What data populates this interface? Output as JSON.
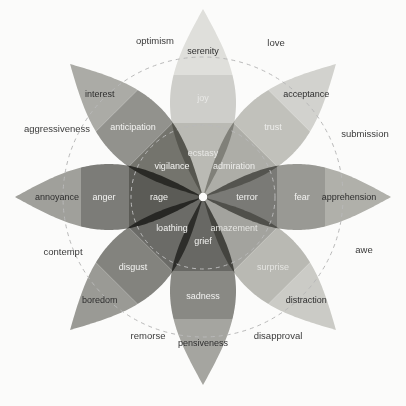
{
  "figure": {
    "name": "plutchik-wheel-of-emotions",
    "background": "#fbfbfa",
    "center": {
      "x": 203,
      "y": 197
    },
    "guide_circles": [
      {
        "name": "inner-dashed-circle",
        "r": 72
      },
      {
        "name": "outer-dashed-circle",
        "r": 140
      }
    ],
    "dash_color": "#b9b9b9"
  },
  "chart_data": {
    "type": "pie",
    "xlabel": "",
    "ylabel": "",
    "legend_position": "none",
    "grid": true,
    "petal_count": 8,
    "intensity_levels": [
      "mild",
      "basic",
      "intense"
    ],
    "categories": [
      "joy",
      "trust",
      "fear",
      "surprise",
      "sadness",
      "disgust",
      "anger",
      "anticipation"
    ],
    "values": [
      1,
      1,
      1,
      1,
      1,
      1,
      1,
      1
    ]
  },
  "petals": [
    {
      "name": "petal-joy",
      "angle": 0,
      "outer": {
        "label": "serenity",
        "fill": "#e3e3e0",
        "text": "#2e2e2e"
      },
      "mid": {
        "label": "joy",
        "fill": "#d2d2ce",
        "text": "#e8e8e6"
      },
      "inner": {
        "label": "ecstasy",
        "fill": "#bdbdb8",
        "text": "#e8e8e6"
      }
    },
    {
      "name": "petal-trust",
      "angle": 45,
      "outer": {
        "label": "acceptance",
        "fill": "#d6d6d2",
        "text": "#2e2e2e"
      },
      "mid": {
        "label": "trust",
        "fill": "#c4c4bf",
        "text": "#eeeeec"
      },
      "inner": {
        "label": "admiration",
        "fill": "#b0b0ab",
        "text": "#eeeeec"
      }
    },
    {
      "name": "petal-fear",
      "angle": 90,
      "outer": {
        "label": "apprehension",
        "fill": "#b3b3ae",
        "text": "#2e2e2e"
      },
      "mid": {
        "label": "fear",
        "fill": "#9c9c97",
        "text": "#f2f2f0"
      },
      "inner": {
        "label": "terror",
        "fill": "#7c7c78",
        "text": "#f2f2f0"
      }
    },
    {
      "name": "petal-surprise",
      "angle": 135,
      "outer": {
        "label": "distraction",
        "fill": "#cfcfca",
        "text": "#2e2e2e"
      },
      "mid": {
        "label": "surprise",
        "fill": "#bcbcb7",
        "text": "#e4e4e1"
      },
      "inner": {
        "label": "amazement",
        "fill": "#a6a6a1",
        "text": "#e4e4e1"
      }
    },
    {
      "name": "petal-sadness",
      "angle": 180,
      "outer": {
        "label": "pensiveness",
        "fill": "#a8a8a3",
        "text": "#2e2e2e"
      },
      "mid": {
        "label": "sadness",
        "fill": "#8b8b87",
        "text": "#f2f2f0"
      },
      "inner": {
        "label": "grief",
        "fill": "#6a6a66",
        "text": "#f2f2f0"
      }
    },
    {
      "name": "petal-disgust",
      "angle": 225,
      "outer": {
        "label": "boredom",
        "fill": "#9d9d98",
        "text": "#2e2e2e"
      },
      "mid": {
        "label": "disgust",
        "fill": "#858581",
        "text": "#f4f4f2"
      },
      "inner": {
        "label": "loathing",
        "fill": "#6d6d69",
        "text": "#f4f4f2"
      }
    },
    {
      "name": "petal-anger",
      "angle": 270,
      "outer": {
        "label": "annoyance",
        "fill": "#a3a39e",
        "text": "#2e2e2e"
      },
      "mid": {
        "label": "anger",
        "fill": "#7e7e7a",
        "text": "#f4f4f2"
      },
      "inner": {
        "label": "rage",
        "fill": "#5c5c58",
        "text": "#f4f4f2"
      }
    },
    {
      "name": "petal-anticipation",
      "angle": 315,
      "outer": {
        "label": "interest",
        "fill": "#aeaea9",
        "text": "#2e2e2e"
      },
      "mid": {
        "label": "anticipation",
        "fill": "#949490",
        "text": "#f4f4f2"
      },
      "inner": {
        "label": "vigilance",
        "fill": "#76766f",
        "text": "#f4f4f2"
      }
    }
  ],
  "dyads": [
    {
      "name": "dyad-optimism",
      "label": "optimism",
      "x": 155,
      "y": 44,
      "anchor": "middle"
    },
    {
      "name": "dyad-love",
      "label": "love",
      "x": 276,
      "y": 46,
      "anchor": "middle"
    },
    {
      "name": "dyad-submission",
      "label": "submission",
      "x": 365,
      "y": 137,
      "anchor": "middle"
    },
    {
      "name": "dyad-awe",
      "label": "awe",
      "x": 364,
      "y": 253,
      "anchor": "middle"
    },
    {
      "name": "dyad-disapproval",
      "label": "disapproval",
      "x": 278,
      "y": 339,
      "anchor": "middle"
    },
    {
      "name": "dyad-remorse",
      "label": "remorse",
      "x": 148,
      "y": 339,
      "anchor": "middle"
    },
    {
      "name": "dyad-contempt",
      "label": "contempt",
      "x": 63,
      "y": 255,
      "anchor": "middle"
    },
    {
      "name": "dyad-aggressiveness",
      "label": "aggressiveness",
      "x": 57,
      "y": 132,
      "anchor": "middle"
    }
  ]
}
